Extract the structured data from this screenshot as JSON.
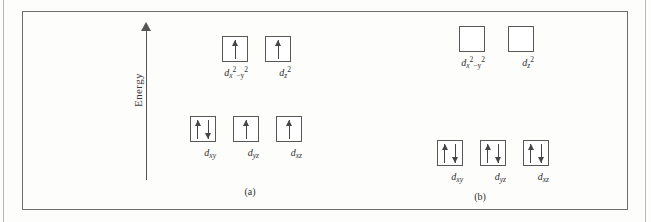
{
  "figure": {
    "axis": {
      "label": "Energy",
      "direction": "up"
    },
    "panels": [
      {
        "id": "panel-a",
        "caption": "(a)",
        "levels": [
          {
            "id": "eg",
            "orbitals": [
              {
                "name": "dx2-y2",
                "label_base": "d",
                "label_sub": "x",
                "label_sup": "2",
                "label_minus": "−y",
                "label_sup2": "2",
                "electrons": [
                  "up"
                ]
              },
              {
                "name": "dz2",
                "label_base": "d",
                "label_sub": "z",
                "label_sup": "2",
                "label_minus": "",
                "label_sup2": "",
                "electrons": [
                  "up"
                ]
              }
            ]
          },
          {
            "id": "t2g",
            "orbitals": [
              {
                "name": "dxy",
                "label_base": "d",
                "label_sub": "xy",
                "label_sup": "",
                "label_minus": "",
                "label_sup2": "",
                "electrons": [
                  "up",
                  "down"
                ]
              },
              {
                "name": "dyz",
                "label_base": "d",
                "label_sub": "yz",
                "label_sup": "",
                "label_minus": "",
                "label_sup2": "",
                "electrons": [
                  "up"
                ]
              },
              {
                "name": "dxz",
                "label_base": "d",
                "label_sub": "xz",
                "label_sup": "",
                "label_minus": "",
                "label_sup2": "",
                "electrons": [
                  "up"
                ]
              }
            ]
          }
        ]
      },
      {
        "id": "panel-b",
        "caption": "(b)",
        "levels": [
          {
            "id": "eg",
            "orbitals": [
              {
                "name": "dx2-y2",
                "label_base": "d",
                "label_sub": "x",
                "label_sup": "2",
                "label_minus": "−y",
                "label_sup2": "2",
                "electrons": []
              },
              {
                "name": "dz2",
                "label_base": "d",
                "label_sub": "z",
                "label_sup": "2",
                "label_minus": "",
                "label_sup2": "",
                "electrons": []
              }
            ]
          },
          {
            "id": "t2g",
            "orbitals": [
              {
                "name": "dxy",
                "label_base": "d",
                "label_sub": "xy",
                "label_sup": "",
                "label_minus": "",
                "label_sup2": "",
                "electrons": [
                  "up",
                  "down"
                ]
              },
              {
                "name": "dyz",
                "label_base": "d",
                "label_sub": "yz",
                "label_sup": "",
                "label_minus": "",
                "label_sup2": "",
                "electrons": [
                  "up",
                  "down"
                ]
              },
              {
                "name": "dxz",
                "label_base": "d",
                "label_sub": "xz",
                "label_sup": "",
                "label_minus": "",
                "label_sup2": "",
                "electrons": [
                  "up",
                  "down"
                ]
              }
            ]
          }
        ]
      }
    ]
  },
  "layout": {
    "positions": {
      "panel_a_eg": [
        222,
        36,
        265,
        36
      ],
      "panel_a_t2g": [
        190,
        116,
        233,
        116,
        276,
        116
      ],
      "panel_b_eg": [
        459,
        26,
        508,
        26
      ],
      "panel_b_t2g": [
        437,
        140,
        480,
        140,
        523,
        140
      ]
    },
    "captions": [
      [
        230,
        186
      ],
      [
        460,
        191
      ]
    ]
  },
  "colors": {
    "frame": "#6d6d6d",
    "box": "#585858",
    "arrow": "#454545",
    "text": "#2e2e2e",
    "axis": "#555555",
    "background": "#fdfdfc"
  }
}
